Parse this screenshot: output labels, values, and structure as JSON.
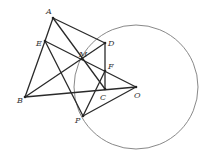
{
  "figure": {
    "circle": {
      "center": "O",
      "cx": 136,
      "cy": 87,
      "r": 62
    },
    "points": [
      {
        "name": "A",
        "x": 53,
        "y": 18,
        "label": "A",
        "lx": 46,
        "ly": 14
      },
      {
        "name": "E",
        "x": 45,
        "y": 41,
        "label": "E",
        "lx": 36,
        "ly": 46
      },
      {
        "name": "D",
        "x": 105,
        "y": 43,
        "label": "D",
        "lx": 108,
        "ly": 46
      },
      {
        "name": "M",
        "x": 82,
        "y": 59,
        "label": "M",
        "lx": 79,
        "ly": 57
      },
      {
        "name": "F",
        "x": 105,
        "y": 71,
        "label": "F",
        "lx": 108,
        "ly": 69
      },
      {
        "name": "B",
        "x": 25,
        "y": 97,
        "label": "B",
        "lx": 17,
        "ly": 103
      },
      {
        "name": "C",
        "x": 105,
        "y": 89,
        "label": "C",
        "lx": 100,
        "ly": 100
      },
      {
        "name": "O",
        "x": 136,
        "y": 87,
        "label": "O",
        "lx": 134,
        "ly": 98
      },
      {
        "name": "P",
        "x": 83,
        "y": 116,
        "label": "P",
        "lx": 75,
        "ly": 123
      }
    ],
    "segments": [
      [
        "A",
        "E"
      ],
      [
        "E",
        "B"
      ],
      [
        "A",
        "D"
      ],
      [
        "A",
        "C"
      ],
      [
        "E",
        "O"
      ],
      [
        "E",
        "P"
      ],
      [
        "B",
        "D"
      ],
      [
        "B",
        "O"
      ],
      [
        "D",
        "C"
      ],
      [
        "P",
        "F"
      ],
      [
        "P",
        "O"
      ]
    ]
  }
}
